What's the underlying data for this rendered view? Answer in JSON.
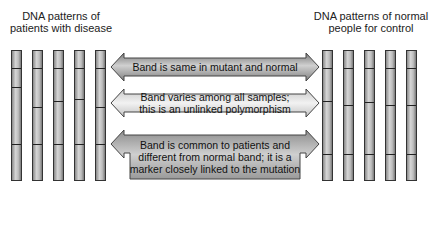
{
  "titles": {
    "left": [
      "DNA patterns of",
      "patients with disease"
    ],
    "right": [
      "DNA patterns of normal",
      "people for control"
    ]
  },
  "lanes": {
    "left": [
      {
        "x": 11,
        "bands": [
          67,
          86,
          143
        ]
      },
      {
        "x": 32,
        "bands": [
          67,
          106,
          143
        ]
      },
      {
        "x": 53,
        "bands": [
          67,
          100,
          143
        ]
      },
      {
        "x": 74,
        "bands": [
          67,
          98,
          143
        ]
      },
      {
        "x": 95,
        "bands": [
          67,
          106,
          143
        ]
      }
    ],
    "right": [
      {
        "x": 322,
        "bands": [
          67,
          100,
          153
        ]
      },
      {
        "x": 343,
        "bands": [
          67,
          104,
          153
        ]
      },
      {
        "x": 364,
        "bands": [
          67,
          101,
          153
        ]
      },
      {
        "x": 385,
        "bands": [
          67,
          104,
          153
        ]
      },
      {
        "x": 406,
        "bands": [
          67,
          104,
          153
        ]
      }
    ]
  },
  "arrows": [
    {
      "lines": [
        "Band is same in mutant and normal"
      ],
      "fill": "#9a9a9a"
    },
    {
      "lines": [
        "Band varies among all samples;",
        "this is an unlinked polymorphism"
      ],
      "fill": "#d8d8d8"
    },
    {
      "lines": [
        "Band is common to patients and",
        "different from normal band; it is a",
        "marker closely linked to the mutation"
      ],
      "fill": "#a8a8a8"
    }
  ],
  "colors": {
    "lane_border": "#333333",
    "band": "#222222",
    "arrow_stroke": "#444444"
  }
}
